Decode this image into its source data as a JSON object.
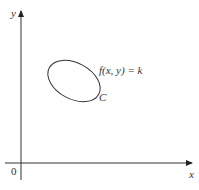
{
  "diagram": {
    "axes": {
      "x_label": "x",
      "y_label": "y",
      "origin_label": "0"
    },
    "curve": {
      "name": "C",
      "equation": "f(x, y) = k",
      "shape": "closed level curve (ellipse)"
    }
  }
}
